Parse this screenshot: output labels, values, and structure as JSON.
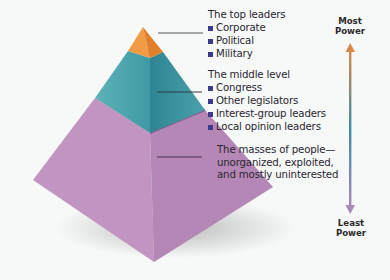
{
  "diagram": {
    "levels": [
      {
        "id": "top",
        "heading": "The top leaders",
        "items": [
          "Corporate",
          "Political",
          "Military"
        ],
        "color": "#e98b3a"
      },
      {
        "id": "middle",
        "heading": "The middle level",
        "items": [
          "Congress",
          "Other legislators",
          "Interest-group leaders",
          "Local opinion leaders"
        ],
        "color": "#3f9aa6"
      },
      {
        "id": "masses",
        "lines": [
          "The masses of people—",
          "unorganized, exploited,",
          "and mostly uninterested"
        ],
        "color": "#b68ab6"
      }
    ],
    "scale": {
      "top_label_line1": "Most",
      "top_label_line2": "Power",
      "bottom_label_line1": "Least",
      "bottom_label_line2": "Power",
      "arrow_top_color": "#d9894a",
      "arrow_mid_color": "#3a8ea6",
      "arrow_bottom_color": "#a888b8"
    },
    "bullet_color": "#3b3a8c"
  }
}
